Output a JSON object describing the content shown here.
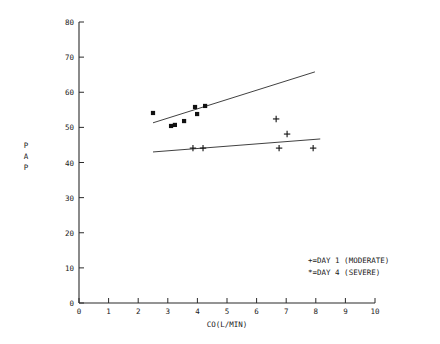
{
  "chart_data": {
    "type": "scatter",
    "title": "",
    "xlabel": "CO(L/MIN)",
    "ylabel": "PAP",
    "xlim": [
      0,
      10
    ],
    "ylim": [
      0,
      80
    ],
    "xticks": [
      0,
      1,
      2,
      3,
      4,
      5,
      6,
      7,
      8,
      9,
      10
    ],
    "yticks": [
      0,
      10,
      20,
      30,
      40,
      50,
      60,
      70,
      80
    ],
    "xtick_labels": [
      "0",
      "1",
      "2",
      "3",
      "4",
      "5",
      "6",
      "7",
      "8",
      "9",
      "10"
    ],
    "ytick_labels": [
      "0",
      "10",
      "20",
      "30",
      "40",
      "50",
      "60",
      "70",
      "80"
    ],
    "grid": false,
    "legend_position": "lower-right",
    "series": [
      {
        "name": "DAY 1 (MODERATE)",
        "marker": "+",
        "legend_entry": "+=DAY 1 (MODERATE)",
        "points": [
          {
            "x": 3.85,
            "y": 44.1
          },
          {
            "x": 4.19,
            "y": 44.1
          },
          {
            "x": 6.66,
            "y": 52.4
          },
          {
            "x": 7.03,
            "y": 48.1
          },
          {
            "x": 6.76,
            "y": 44.1
          },
          {
            "x": 7.91,
            "y": 44.1
          }
        ],
        "fit_line": {
          "x1": 2.5,
          "y1": 43.0,
          "x2": 8.15,
          "y2": 46.7
        }
      },
      {
        "name": "DAY 4 (SEVERE)",
        "marker": "*",
        "legend_entry": "*=DAY 4 (SEVERE)",
        "points": [
          {
            "x": 2.5,
            "y": 54.1
          },
          {
            "x": 3.11,
            "y": 50.4
          },
          {
            "x": 3.24,
            "y": 50.7
          },
          {
            "x": 3.55,
            "y": 51.8
          },
          {
            "x": 3.92,
            "y": 55.8
          },
          {
            "x": 3.99,
            "y": 53.8
          },
          {
            "x": 4.26,
            "y": 56.1
          }
        ],
        "fit_line": {
          "x1": 2.5,
          "y1": 51.3,
          "x2": 7.97,
          "y2": 65.8
        }
      }
    ]
  },
  "axes": {
    "y_axis_label_chars": [
      "P",
      "A",
      "P"
    ],
    "x_axis_label": "CO(L/MIN)"
  },
  "legend": {
    "entries": [
      {
        "symbol": "+",
        "equals": "=",
        "label": "DAY 1 (MODERATE)",
        "text": "+=DAY 1 (MODERATE)"
      },
      {
        "symbol": "*",
        "equals": "=",
        "label": "DAY 4 (SEVERE)",
        "text": "*=DAY 4 (SEVERE)"
      }
    ]
  },
  "colors": {
    "background": "#ffffff",
    "ink": "#1a1a1a",
    "axis": "#2b2b2b",
    "marker": "#111111"
  }
}
